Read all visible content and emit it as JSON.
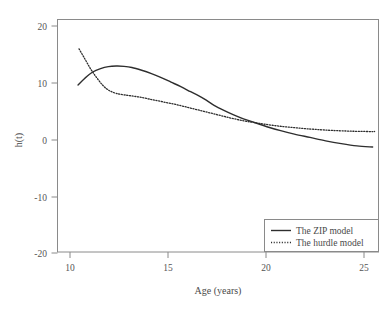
{
  "figure": {
    "background_color": "#ffffff",
    "frame_color": "#8a8a8a",
    "text_color": "#4a4a4a"
  },
  "chart_data": {
    "type": "line",
    "title": "",
    "subtitle": "",
    "xlabel": "Age (years)",
    "ylabel": "h(t)",
    "xlim": [
      9.5,
      25.9
    ],
    "ylim": [
      -20.6,
      20.6
    ],
    "xticks": [
      10,
      15,
      20,
      25
    ],
    "xtick_labels": [
      "10",
      "15",
      "20",
      "25"
    ],
    "yticks": [
      20,
      10,
      0,
      -10,
      -20
    ],
    "ytick_labels": [
      "20",
      "10",
      "0",
      "-10",
      "-20"
    ],
    "grid": false,
    "legend_position": "lower right",
    "series": [
      {
        "name": "The ZIP model",
        "style": "solid",
        "color": "#2e2e2e",
        "width": 1.4,
        "x": [
          10.55,
          10.9,
          11.3,
          11.7,
          12.1,
          12.5,
          12.9,
          13.3,
          13.8,
          14.3,
          14.8,
          15.3,
          15.8,
          16.3,
          16.7,
          17.1,
          17.5,
          18.0,
          18.5,
          19.0,
          19.6,
          20.2,
          20.9,
          21.6,
          22.4,
          23.2,
          24.0,
          24.8,
          25.6
        ],
        "y": [
          9.0,
          10.2,
          11.3,
          11.9,
          12.25,
          12.35,
          12.3,
          12.1,
          11.6,
          11.0,
          10.3,
          9.5,
          8.7,
          7.8,
          7.1,
          6.3,
          5.4,
          4.5,
          3.7,
          3.0,
          2.3,
          1.6,
          0.9,
          0.3,
          -0.3,
          -0.9,
          -1.4,
          -1.8,
          -2.0
        ]
      },
      {
        "name": "The hurdle model",
        "style": "dotted",
        "color": "#2e2e2e",
        "width": 1.3,
        "x": [
          10.6,
          10.9,
          11.2,
          11.5,
          11.8,
          12.1,
          12.5,
          13.0,
          13.6,
          14.2,
          14.9,
          15.6,
          16.3,
          17.0,
          17.7,
          18.4,
          19.1,
          19.8,
          20.6,
          21.4,
          22.2,
          23.0,
          23.8,
          24.6,
          25.4,
          25.7
        ],
        "y": [
          15.4,
          13.6,
          11.8,
          10.3,
          9.0,
          8.1,
          7.5,
          7.2,
          6.9,
          6.5,
          6.0,
          5.5,
          4.9,
          4.3,
          3.7,
          3.1,
          2.6,
          2.2,
          1.8,
          1.5,
          1.25,
          1.05,
          0.9,
          0.8,
          0.75,
          0.75
        ]
      }
    ],
    "legend_entries": [
      {
        "label": "The ZIP model",
        "style": "solid"
      },
      {
        "label": "The hurdle model",
        "style": "dotted"
      }
    ]
  }
}
